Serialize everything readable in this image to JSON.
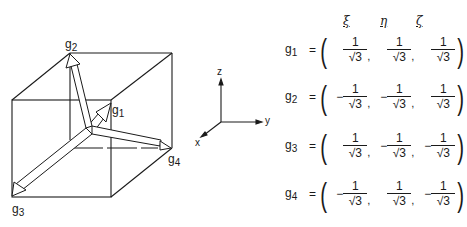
{
  "figure": {
    "vector_labels": [
      "g1",
      "g2",
      "g3",
      "g4"
    ],
    "axes": {
      "z": "z",
      "y": "y",
      "x": "x"
    }
  },
  "table": {
    "headers": [
      "ξ",
      "η",
      "ζ"
    ],
    "rows": [
      {
        "name": "g",
        "sub": "1",
        "eq": "=",
        "entries": [
          {
            "sign": "",
            "num": "1",
            "den": "√3"
          },
          {
            "sign": "",
            "num": "1",
            "den": "√3"
          },
          {
            "sign": "",
            "num": "1",
            "den": "√3"
          }
        ]
      },
      {
        "name": "g",
        "sub": "2",
        "eq": "=",
        "entries": [
          {
            "sign": "−",
            "num": "1",
            "den": "√3"
          },
          {
            "sign": "−",
            "num": "1",
            "den": "√3"
          },
          {
            "sign": "",
            "num": "1",
            "den": "√3"
          }
        ]
      },
      {
        "name": "g",
        "sub": "3",
        "eq": "=",
        "entries": [
          {
            "sign": "",
            "num": "1",
            "den": "√3"
          },
          {
            "sign": "−",
            "num": "1",
            "den": "√3"
          },
          {
            "sign": "−",
            "num": "1",
            "den": "√3"
          }
        ]
      },
      {
        "name": "g",
        "sub": "4",
        "eq": "=",
        "entries": [
          {
            "sign": "−",
            "num": "1",
            "den": "√3"
          },
          {
            "sign": "",
            "num": "1",
            "den": "√3"
          },
          {
            "sign": "−",
            "num": "1",
            "den": "√3"
          }
        ]
      }
    ]
  }
}
